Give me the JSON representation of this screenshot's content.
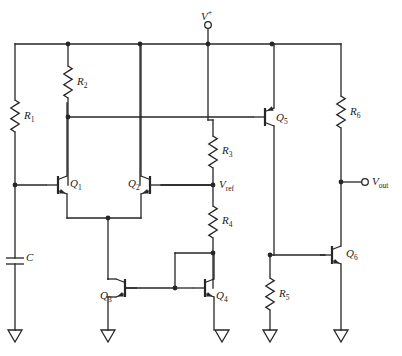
{
  "figure": {
    "kind": "schematic",
    "stroke_color": "#262626",
    "background": "#ffffff"
  },
  "terminals": [
    {
      "id": "vplus",
      "name": "supply-terminal",
      "label": "V",
      "sup": "+",
      "sub": "",
      "x": 208,
      "y": 25
    },
    {
      "id": "vout",
      "name": "output-terminal",
      "label": "V",
      "sup": "",
      "sub": "out",
      "x": 365,
      "y": 182
    }
  ],
  "nodes": [
    {
      "id": "vref",
      "name": "vref-node",
      "label": "V",
      "sub": "ref",
      "x": 213,
      "y": 185
    }
  ],
  "resistors": [
    {
      "id": "R1",
      "label": "R",
      "sub": "1",
      "x": 15,
      "y_top": 100,
      "y_bot": 132,
      "label_x": 24,
      "label_y": 110
    },
    {
      "id": "R2",
      "label": "R",
      "sub": "2",
      "x": 68,
      "y_top": 66,
      "y_bot": 98,
      "label_x": 77,
      "label_y": 76
    },
    {
      "id": "R3",
      "label": "R",
      "sub": "3",
      "x": 213,
      "y_top": 136,
      "y_bot": 168,
      "label_x": 222,
      "label_y": 145
    },
    {
      "id": "R4",
      "label": "R",
      "sub": "4",
      "x": 213,
      "y_top": 206,
      "y_bot": 238,
      "label_x": 222,
      "label_y": 215
    },
    {
      "id": "R5",
      "label": "R",
      "sub": "5",
      "x": 270,
      "y_top": 278,
      "y_bot": 310,
      "label_x": 279,
      "label_y": 288
    },
    {
      "id": "R6",
      "label": "R",
      "sub": "6",
      "x": 341,
      "y_top": 96,
      "y_bot": 128,
      "label_x": 350,
      "label_y": 106
    }
  ],
  "capacitors": [
    {
      "id": "C",
      "label": "C",
      "x": 15,
      "y": 258,
      "label_x": 26,
      "label_y": 252
    }
  ],
  "transistors": [
    {
      "id": "Q1",
      "label": "Q",
      "sub": "1",
      "type": "npn",
      "orient": "base-left",
      "label_x": 70,
      "label_y": 178
    },
    {
      "id": "Q2",
      "label": "Q",
      "sub": "2",
      "type": "npn",
      "orient": "base-right",
      "label_x": 128,
      "label_y": 178
    },
    {
      "id": "Q3",
      "label": "Q",
      "sub": "3",
      "type": "npn",
      "orient": "base-right",
      "label_x": 100,
      "label_y": 290
    },
    {
      "id": "Q4",
      "label": "Q",
      "sub": "4",
      "type": "npn",
      "orient": "base-left",
      "label_x": 216,
      "label_y": 290
    },
    {
      "id": "Q5",
      "label": "Q",
      "sub": "5",
      "type": "pnp",
      "orient": "base-left",
      "label_x": 276,
      "label_y": 112
    },
    {
      "id": "Q6",
      "label": "Q",
      "sub": "6",
      "type": "npn",
      "orient": "base-left",
      "label_x": 346,
      "label_y": 248
    }
  ],
  "grounds": [
    {
      "id": "gnd1",
      "name": "ground-symbol-c",
      "x": 15,
      "y": 330
    },
    {
      "id": "gnd2",
      "name": "ground-symbol-q3",
      "x": 108,
      "y": 330
    },
    {
      "id": "gnd3",
      "name": "ground-symbol-q4",
      "x": 222,
      "y": 330
    },
    {
      "id": "gnd4",
      "name": "ground-symbol-r5",
      "x": 270,
      "y": 330
    },
    {
      "id": "gnd5",
      "name": "ground-symbol-q6",
      "x": 341,
      "y": 330
    }
  ],
  "junction_dots": [
    {
      "x": 68,
      "y": 44
    },
    {
      "x": 140,
      "y": 44
    },
    {
      "x": 208,
      "y": 44
    },
    {
      "x": 272,
      "y": 44
    },
    {
      "x": 68,
      "y": 117
    },
    {
      "x": 15,
      "y": 185
    },
    {
      "x": 213,
      "y": 185
    },
    {
      "x": 341,
      "y": 182
    },
    {
      "x": 108,
      "y": 218
    },
    {
      "x": 213,
      "y": 253
    },
    {
      "x": 175,
      "y": 288
    },
    {
      "x": 270,
      "y": 255
    }
  ]
}
